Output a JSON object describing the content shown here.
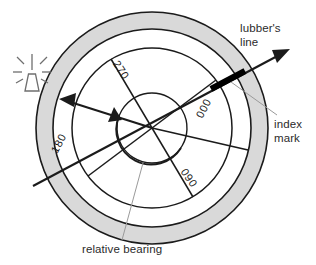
{
  "figure": {
    "kind": "relative-bearing-compass-diagram",
    "background_color": "#ffffff",
    "ring_fill_color": "#d9d9d9",
    "ring_stroke_color": "#1b1b1b",
    "line_color": "#1b1b1b",
    "index_mark_color": "#000000",
    "leader_color": "#9a9a9a",
    "text_color": "#2b2b2b"
  },
  "compass_card": {
    "labels": [
      {
        "value": "270",
        "position": "upper-left",
        "rotation_deg": 58
      },
      {
        "value": "000",
        "position": "upper-right",
        "rotation_deg": -60
      },
      {
        "value": "090",
        "position": "lower-right",
        "rotation_deg": 55
      },
      {
        "value": "180",
        "position": "lower-left",
        "rotation_deg": -62
      }
    ]
  },
  "annotations": {
    "lubbers_line": {
      "line1": "lubber's",
      "line2": "line"
    },
    "index_mark": {
      "line1": "index",
      "line2": "mark"
    },
    "relative_bearing": {
      "text": "relative  bearing"
    }
  },
  "icons": {
    "beacon": "lighthouse-beacon-icon",
    "lubbers_arrow": "arrow-head-icon",
    "bearing_arrow": "arrow-head-icon",
    "bearing_arc_arrow": "arc-arrow-head-icon"
  }
}
